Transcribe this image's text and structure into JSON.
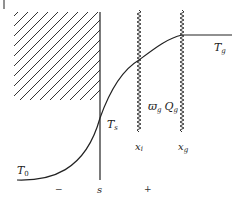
{
  "diagram": {
    "type": "temperature-profile",
    "labels": {
      "T_g": "T",
      "T_g_sub": "g",
      "T_s": "T",
      "T_s_sub": "s",
      "T_0": "T",
      "T_0_sub": "0",
      "x_i": "x",
      "x_i_sub": "i",
      "x_g": "x",
      "x_g_sub": "g",
      "omega": "ϖ",
      "omega_sub": "g",
      "Q": "Q",
      "Q_sub": "g",
      "surface": "s",
      "minus": "−",
      "plus": "+"
    },
    "colors": {
      "line": "#222222",
      "hatch": "#333333",
      "background": "#ffffff"
    }
  }
}
